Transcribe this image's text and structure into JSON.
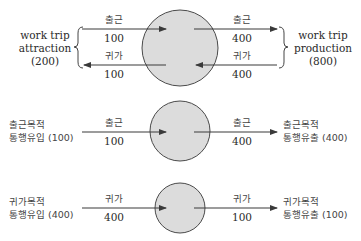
{
  "colors": {
    "circle_fill": "#dcdcdc",
    "circle_stroke": "#4a4a4a",
    "arrow": "#3a3a3a",
    "text": "#2a2a2a"
  },
  "panel1": {
    "left_group": {
      "line1": "work trip",
      "line2": "attraction",
      "line3": "(200)"
    },
    "right_group": {
      "line1": "work trip",
      "line2": "production",
      "line3": "(800)"
    },
    "in_top": {
      "label": "출근",
      "value": "100"
    },
    "in_bottom": {
      "label": "귀가",
      "value": "100"
    },
    "out_top": {
      "label": "출근",
      "value": "400"
    },
    "out_bottom": {
      "label": "귀가",
      "value": "400"
    }
  },
  "panel2": {
    "left": {
      "line1": "출근목적",
      "line2": "통행유입 (100)"
    },
    "in_arrow": {
      "label": "출근",
      "value": "100"
    },
    "out_arrow": {
      "label": "출근",
      "value": "400"
    },
    "right": {
      "line1": "출근목적",
      "line2": "통행유출 (400)"
    }
  },
  "panel3": {
    "left": {
      "line1": "귀가목적",
      "line2": "통행유입 (400)"
    },
    "in_arrow": {
      "label": "귀가",
      "value": "400"
    },
    "out_arrow": {
      "label": "귀가",
      "value": "100"
    },
    "right": {
      "line1": "귀가목적",
      "line2": "통행유출 (100)"
    }
  }
}
